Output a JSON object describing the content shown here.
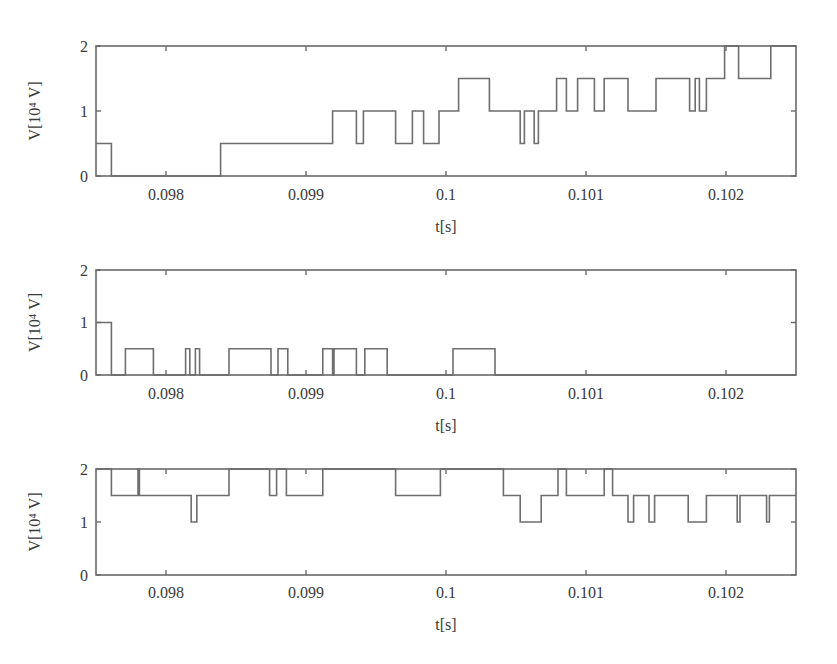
{
  "figure": {
    "width": 837,
    "height": 664,
    "line_color": "#6e6e6e",
    "text_color": "#3a3a3a"
  },
  "chart_data": [
    {
      "type": "line",
      "step": true,
      "title": "",
      "xlabel": "t[s]",
      "ylabel": "V[10⁴ V]",
      "xlim": [
        0.0975,
        0.1025
      ],
      "ylim": [
        0,
        2
      ],
      "xticks": [
        0.098,
        0.099,
        0.1,
        0.101,
        0.102
      ],
      "xtick_labels": [
        "0.098",
        "0.099",
        "0.1",
        "0.101",
        "0.102"
      ],
      "yticks": [
        0,
        1,
        2
      ],
      "ytick_labels": [
        "0",
        "1",
        "2"
      ],
      "grid": false,
      "legend": null,
      "series": [
        {
          "name": "subplot-1",
          "points": [
            [
              0.0975,
              0.5
            ],
            [
              0.09761,
              0
            ],
            [
              0.09839,
              0.5
            ],
            [
              0.09919,
              1
            ],
            [
              0.09936,
              0.5
            ],
            [
              0.09941,
              1
            ],
            [
              0.09964,
              0.5
            ],
            [
              0.09976,
              1
            ],
            [
              0.09984,
              0.5
            ],
            [
              0.09995,
              1
            ],
            [
              0.10009,
              1.5
            ],
            [
              0.10031,
              1
            ],
            [
              0.10053,
              0.5
            ],
            [
              0.10056,
              1
            ],
            [
              0.10063,
              0.5
            ],
            [
              0.10066,
              1
            ],
            [
              0.10079,
              1.5
            ],
            [
              0.10086,
              1
            ],
            [
              0.10094,
              1.5
            ],
            [
              0.10106,
              1
            ],
            [
              0.10113,
              1.5
            ],
            [
              0.1013,
              1
            ],
            [
              0.1015,
              1.5
            ],
            [
              0.10174,
              1
            ],
            [
              0.10178,
              1.5
            ],
            [
              0.10181,
              1
            ],
            [
              0.10186,
              1.5
            ],
            [
              0.10199,
              2
            ],
            [
              0.10209,
              1.5
            ],
            [
              0.10232,
              2
            ],
            [
              0.1025,
              2
            ]
          ]
        }
      ]
    },
    {
      "type": "line",
      "step": true,
      "title": "",
      "xlabel": "t[s]",
      "ylabel": "V[10⁴ V]",
      "xlim": [
        0.0975,
        0.1025
      ],
      "ylim": [
        0,
        2
      ],
      "xticks": [
        0.098,
        0.099,
        0.1,
        0.101,
        0.102
      ],
      "xtick_labels": [
        "0.098",
        "0.099",
        "0.1",
        "0.101",
        "0.102"
      ],
      "yticks": [
        0,
        1,
        2
      ],
      "ytick_labels": [
        "0",
        "1",
        "2"
      ],
      "grid": false,
      "legend": null,
      "series": [
        {
          "name": "subplot-2",
          "points": [
            [
              0.0975,
              1
            ],
            [
              0.09761,
              0
            ],
            [
              0.09771,
              0.5
            ],
            [
              0.09791,
              0
            ],
            [
              0.09814,
              0.5
            ],
            [
              0.09817,
              0
            ],
            [
              0.09821,
              0.5
            ],
            [
              0.09824,
              0
            ],
            [
              0.09845,
              0.5
            ],
            [
              0.09875,
              0
            ],
            [
              0.0988,
              0.5
            ],
            [
              0.09887,
              0
            ],
            [
              0.09912,
              0.5
            ],
            [
              0.09919,
              0
            ],
            [
              0.0992,
              0.5
            ],
            [
              0.09936,
              0
            ],
            [
              0.09942,
              0.5
            ],
            [
              0.09958,
              0
            ],
            [
              0.10005,
              0.5
            ],
            [
              0.10035,
              0
            ],
            [
              0.1025,
              0
            ]
          ]
        }
      ]
    },
    {
      "type": "line",
      "step": true,
      "title": "",
      "xlabel": "t[s]",
      "ylabel": "V[10⁴ V]",
      "xlim": [
        0.0975,
        0.1025
      ],
      "ylim": [
        0,
        2
      ],
      "xticks": [
        0.098,
        0.099,
        0.1,
        0.101,
        0.102
      ],
      "xtick_labels": [
        "0.098",
        "0.099",
        "0.1",
        "0.101",
        "0.102"
      ],
      "yticks": [
        0,
        1,
        2
      ],
      "ytick_labels": [
        "0",
        "1",
        "2"
      ],
      "grid": false,
      "legend": null,
      "series": [
        {
          "name": "subplot-3",
          "points": [
            [
              0.0975,
              2
            ],
            [
              0.09761,
              1.5
            ],
            [
              0.0978,
              2
            ],
            [
              0.09781,
              1.5
            ],
            [
              0.09818,
              1
            ],
            [
              0.09822,
              1.5
            ],
            [
              0.09845,
              2
            ],
            [
              0.09874,
              1.5
            ],
            [
              0.09879,
              2
            ],
            [
              0.09886,
              1.5
            ],
            [
              0.09912,
              2
            ],
            [
              0.09964,
              1.5
            ],
            [
              0.09996,
              2
            ],
            [
              0.10041,
              1.5
            ],
            [
              0.10053,
              1
            ],
            [
              0.10068,
              1.5
            ],
            [
              0.1008,
              2
            ],
            [
              0.10086,
              1.5
            ],
            [
              0.10113,
              2
            ],
            [
              0.10119,
              1.5
            ],
            [
              0.1013,
              1
            ],
            [
              0.10134,
              1.5
            ],
            [
              0.10145,
              1
            ],
            [
              0.10149,
              1.5
            ],
            [
              0.10173,
              1
            ],
            [
              0.10186,
              1.5
            ],
            [
              0.10208,
              1
            ],
            [
              0.1021,
              1.5
            ],
            [
              0.10229,
              1
            ],
            [
              0.10231,
              1.5
            ],
            [
              0.1025,
              1.5
            ]
          ]
        }
      ]
    }
  ],
  "layout": {
    "panels": [
      {
        "left": 96,
        "right": 796,
        "top": 46,
        "bottom": 176,
        "ticklabel_y": 200,
        "xlabel_y": 232,
        "ylabel_x": 40
      },
      {
        "left": 96,
        "right": 796,
        "top": 270,
        "bottom": 375,
        "ticklabel_y": 399,
        "xlabel_y": 431,
        "ylabel_x": 40
      },
      {
        "left": 96,
        "right": 796,
        "top": 469,
        "bottom": 575,
        "ticklabel_y": 598,
        "xlabel_y": 630,
        "ylabel_x": 40
      }
    ]
  }
}
